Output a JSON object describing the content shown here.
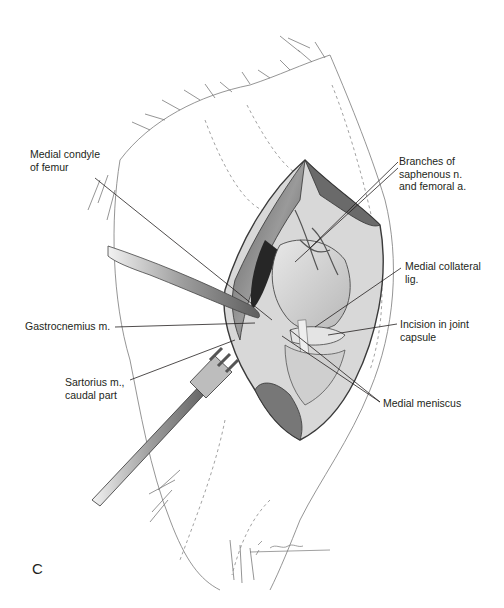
{
  "figure": {
    "panel_letter": "C",
    "labels": [
      {
        "id": "medial-condyle",
        "text": "Medial condyle\nof femur",
        "x": 30,
        "y": 148
      },
      {
        "id": "branches-saphenous",
        "text": "Branches of\nsaphenous n.\nand femoral a.",
        "x": 399,
        "y": 155
      },
      {
        "id": "medial-collateral",
        "text": "Medial collateral\nlig.",
        "x": 405,
        "y": 260
      },
      {
        "id": "gastrocnemius",
        "text": "Gastrocnemius m.",
        "x": 25,
        "y": 320
      },
      {
        "id": "incision-joint-capsule",
        "text": "Incision in joint\ncapsule",
        "x": 400,
        "y": 318
      },
      {
        "id": "sartorius",
        "text": "Sartorius m.,\ncaudal part",
        "x": 65,
        "y": 376
      },
      {
        "id": "medial-meniscus",
        "text": "Medial meniscus",
        "x": 383,
        "y": 397
      }
    ],
    "signature": "artist signature"
  },
  "colors": {
    "ink": "#231f20",
    "shade_dark": "#3a3a3a",
    "shade_mid": "#8a8a8a",
    "shade_light": "#cfcfcf"
  }
}
